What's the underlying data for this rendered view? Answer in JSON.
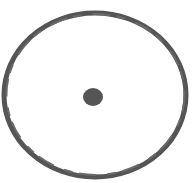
{
  "figure": {
    "stroke_color": "#555555",
    "fill_color": "#555555",
    "background": "#ffffff"
  }
}
